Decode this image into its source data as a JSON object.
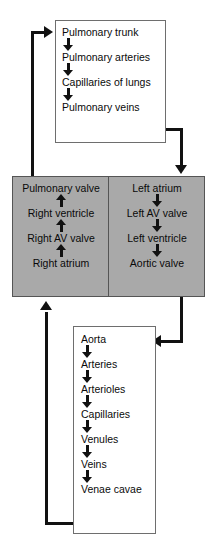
{
  "diagram": {
    "colors": {
      "heart_fill": "#a9a9a9",
      "box_border": "#6e6e6e",
      "arrow": "#111111",
      "text": "#0a0a0a",
      "background": "#ffffff"
    },
    "pulmonary_circuit": {
      "name": "pulmonary-circulation",
      "nodes": [
        "Pulmonary trunk",
        "Pulmonary arteries",
        "Capillaries of lungs",
        "Pulmonary veins"
      ],
      "arrow_direction": "down"
    },
    "heart": {
      "name": "heart",
      "right_side": {
        "name": "right-heart",
        "nodes": [
          "Pulmonary valve",
          "Right ventricle",
          "Right AV valve",
          "Right atrium"
        ],
        "arrow_direction": "up"
      },
      "left_side": {
        "name": "left-heart",
        "nodes": [
          "Left atrium",
          "Left AV valve",
          "Left ventricle",
          "Aortic valve"
        ],
        "arrow_direction": "down"
      }
    },
    "systemic_circuit": {
      "name": "systemic-circulation",
      "nodes": [
        "Aorta",
        "Arteries",
        "Arterioles",
        "Capillaries",
        "Venules",
        "Veins",
        "Venae cavae"
      ],
      "arrow_direction": "down"
    },
    "connectors": [
      {
        "name": "right-heart-to-pulmonary-trunk",
        "from": "Pulmonary valve",
        "to": "Pulmonary trunk",
        "direction": "right"
      },
      {
        "name": "pulmonary-veins-to-left-atrium",
        "from": "Pulmonary veins",
        "to": "Left atrium",
        "direction": "down"
      },
      {
        "name": "aortic-valve-to-aorta",
        "from": "Aortic valve",
        "to": "Aorta",
        "direction": "left"
      },
      {
        "name": "venae-cavae-to-right-atrium",
        "from": "Venae cavae",
        "to": "Right atrium",
        "direction": "up"
      }
    ]
  }
}
